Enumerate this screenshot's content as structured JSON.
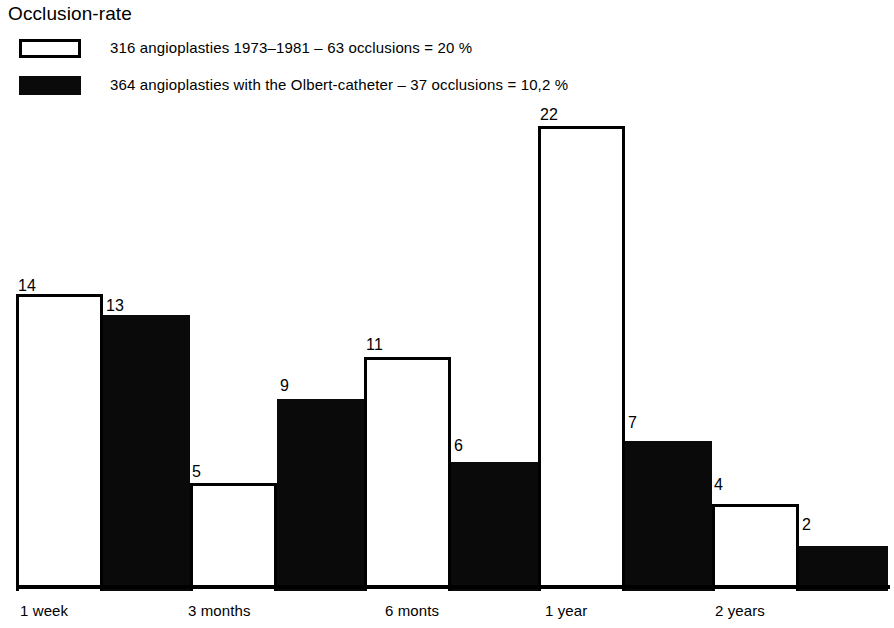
{
  "title": "Occlusion-rate",
  "legend": {
    "items": [
      {
        "swatch": "open-rectangle-swatch",
        "label": "316  angioplasties 1973–1981 – 63 occlusions = 20 %"
      },
      {
        "swatch": "filled-rectangle-swatch",
        "label": "364 angioplasties with the Olbert-catheter – 37 occlusions = 10,2 %"
      }
    ]
  },
  "chart_data": {
    "type": "bar",
    "title": "Occlusion-rate",
    "xlabel": "",
    "ylabel": "",
    "ylim": [
      0,
      22
    ],
    "grid": false,
    "legend_position": "top-left",
    "categories": [
      "1 week",
      "3 months",
      "6 monts",
      "1 year",
      "2 years"
    ],
    "series": [
      {
        "name": "316  angioplasties 1973–1981 – 63 occlusions = 20 %",
        "style": "open",
        "values": [
          14,
          5,
          11,
          22,
          4
        ]
      },
      {
        "name": "364 angioplasties with the Olbert-catheter – 37 occlusions = 10,2 %",
        "style": "filled",
        "values": [
          13,
          9,
          6,
          7,
          2
        ]
      }
    ],
    "bars": [
      {
        "category": "1 week",
        "series": "open",
        "value": 14,
        "label": "14",
        "x": 16,
        "width": 87,
        "label_x": 18,
        "label_y": 277
      },
      {
        "category": "1 week",
        "series": "filled",
        "value": 13,
        "label": "13",
        "x": 103,
        "width": 87,
        "label_x": 106,
        "label_y": 297
      },
      {
        "category": "3 months",
        "series": "open",
        "value": 5,
        "label": "5",
        "x": 190,
        "width": 87,
        "label_x": 192,
        "label_y": 463
      },
      {
        "category": "3 months",
        "series": "filled",
        "value": 9,
        "label": "9",
        "x": 277,
        "width": 87,
        "label_x": 280,
        "label_y": 377
      },
      {
        "category": "6 monts",
        "series": "open",
        "value": 11,
        "label": "11",
        "x": 364,
        "width": 87,
        "label_x": 366,
        "label_y": 336
      },
      {
        "category": "6 monts",
        "series": "filled",
        "value": 6,
        "label": "6",
        "x": 451,
        "width": 87,
        "label_x": 454,
        "label_y": 437
      },
      {
        "category": "1 year",
        "series": "open",
        "value": 22,
        "label": "22",
        "x": 538,
        "width": 87,
        "label_x": 540,
        "label_y": 106
      },
      {
        "category": "1 year",
        "series": "filled",
        "value": 7,
        "label": "7",
        "x": 625,
        "width": 87,
        "label_x": 628,
        "label_y": 414
      },
      {
        "category": "2 years",
        "series": "open",
        "value": 4,
        "label": "4",
        "x": 712,
        "width": 87,
        "label_x": 714,
        "label_y": 476
      },
      {
        "category": "2 years",
        "series": "filled",
        "value": 2,
        "label": "2",
        "x": 799,
        "width": 89,
        "label_x": 802,
        "label_y": 516
      }
    ],
    "axis_labels": [
      {
        "text": "1 week",
        "x": 20
      },
      {
        "text": "3 months",
        "x": 188
      },
      {
        "text": "6 monts",
        "x": 385
      },
      {
        "text": "1 year",
        "x": 545
      },
      {
        "text": "2 years",
        "x": 715
      }
    ],
    "geometry": {
      "baseline_y": 588,
      "pixels_per_unit": 21
    }
  }
}
